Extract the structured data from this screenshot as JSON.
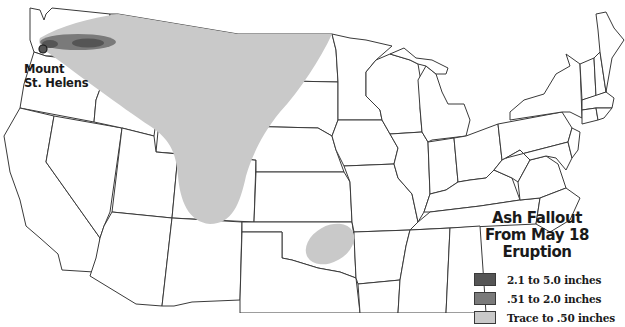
{
  "map": {
    "title_line1": "Ash Fallout",
    "title_line2": "From May 18 Eruption",
    "volcano": {
      "name_line1": "Mount",
      "name_line2": "St. Helens"
    },
    "legend": [
      {
        "label": "2.1 to 5.0 inches",
        "color": "#555555"
      },
      {
        "label": ".51 to 2.0 inches",
        "color": "#7a7a7a"
      },
      {
        "label": "Trace to .50 inches",
        "color": "#c9c9c9"
      }
    ],
    "colors": {
      "state_fill": "#ffffff",
      "state_stroke": "#3a3a3a",
      "trace": "#c9c9c9",
      "moderate": "#7a7a7a",
      "heavy": "#555555"
    }
  }
}
